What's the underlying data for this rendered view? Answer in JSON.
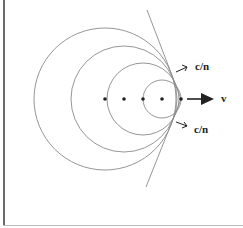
{
  "diagram": {
    "title": "",
    "labels": {
      "upper_wave": "c/n",
      "lower_wave": "c/n",
      "velocity": "v"
    },
    "emission_points": [
      {
        "x": 105,
        "y": 99
      },
      {
        "x": 124,
        "y": 99
      },
      {
        "x": 143,
        "y": 99
      },
      {
        "x": 162,
        "y": 99
      },
      {
        "x": 181,
        "y": 99
      }
    ],
    "wavefronts": [
      {
        "cx": 105,
        "cy": 99,
        "r": 71
      },
      {
        "cx": 124,
        "cy": 99,
        "r": 53
      },
      {
        "cx": 143,
        "cy": 99,
        "r": 36
      },
      {
        "cx": 162,
        "cy": 99,
        "r": 19
      }
    ],
    "tangent_line": {
      "x1": 147,
      "y1": 10,
      "x2": 146,
      "y2": 187
    },
    "colors": {
      "stroke": "#888888",
      "ink": "#222222"
    }
  }
}
